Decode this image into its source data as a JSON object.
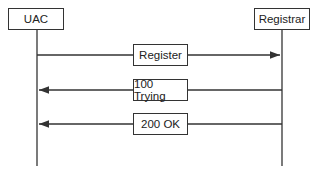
{
  "diagram": {
    "type": "sequence",
    "participants": [
      {
        "id": "uac",
        "label": "UAC"
      },
      {
        "id": "registrar",
        "label": "Registrar"
      }
    ],
    "messages": [
      {
        "from": "uac",
        "to": "registrar",
        "label": "Register"
      },
      {
        "from": "registrar",
        "to": "uac",
        "label": "100 Trying"
      },
      {
        "from": "registrar",
        "to": "uac",
        "label": "200 OK"
      }
    ]
  }
}
